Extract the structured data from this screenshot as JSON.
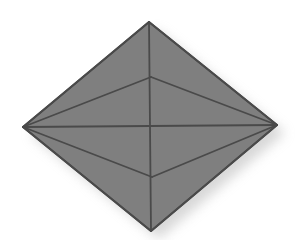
{
  "diagram": {
    "type": "octahedron",
    "colors": {
      "background": "#ffffff",
      "face": "#7f7f7f",
      "edge": "#4a4a4a",
      "shadow": "#b8b8b8"
    },
    "vertices": {
      "top": [
        149,
        22
      ],
      "left": [
        23,
        127
      ],
      "right": [
        277,
        125
      ],
      "bottom": [
        151,
        231
      ],
      "front_upper": [
        151,
        77
      ],
      "front_lower": [
        152,
        177
      ]
    },
    "edges": [
      [
        "top",
        "left"
      ],
      [
        "top",
        "right"
      ],
      [
        "left",
        "bottom"
      ],
      [
        "right",
        "bottom"
      ],
      [
        "top",
        "bottom"
      ],
      [
        "left",
        "right"
      ],
      [
        "left",
        "front_upper"
      ],
      [
        "front_upper",
        "right"
      ],
      [
        "left",
        "front_lower"
      ],
      [
        "front_lower",
        "right"
      ]
    ]
  }
}
